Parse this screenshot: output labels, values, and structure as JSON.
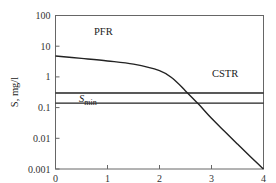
{
  "chart_data": {
    "type": "line",
    "title": "",
    "xlabel": "Travel time through reactor, d",
    "ylabel": "S, mg/l",
    "yscale": "log",
    "xlim": [
      0,
      4
    ],
    "ylim": [
      0.001,
      100
    ],
    "grid": false,
    "x_ticks": [
      "0",
      "1",
      "2",
      "3",
      "4"
    ],
    "y_ticks": [
      "100",
      "10",
      "1",
      "0.1",
      "0.01",
      "0.001"
    ],
    "series": [
      {
        "name": "PFR",
        "x": [
          0,
          0.5,
          1.0,
          1.5,
          2.0,
          2.25,
          2.5,
          2.75,
          3.0,
          3.25,
          3.5,
          3.75,
          4.0
        ],
        "values": [
          4.8,
          4.0,
          3.3,
          2.6,
          1.6,
          0.9,
          0.35,
          0.13,
          0.045,
          0.017,
          0.0065,
          0.0025,
          0.001
        ]
      },
      {
        "name": "CSTR",
        "x": [
          0,
          4
        ],
        "values": [
          0.3,
          0.3
        ]
      },
      {
        "name": "S_min",
        "x": [
          0,
          4
        ],
        "values": [
          0.14,
          0.14
        ]
      }
    ],
    "annotations": [
      {
        "text": "PFR",
        "x": 1.2,
        "y": 5.5
      },
      {
        "text": "CSTR",
        "x": 3.1,
        "y": 0.5
      },
      {
        "text": "S",
        "subscript": "min",
        "x": 0.5,
        "y": 0.045
      }
    ]
  },
  "labels": {
    "pfr": "PFR",
    "cstr": "CSTR",
    "smin_main": "S",
    "smin_sub": "min",
    "ylabel": "S, mg/l",
    "xlabel": "Travel time through reactor, d"
  },
  "colors": {
    "line": "#222222",
    "frame": "#555555"
  }
}
